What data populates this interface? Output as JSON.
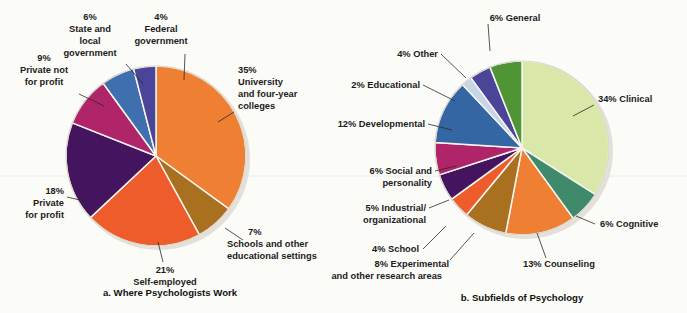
{
  "figure": {
    "background": "#fbfbf8",
    "text_color": "#1b1b1b"
  },
  "chart_data": [
    {
      "type": "pie",
      "id": "where-psychologists-work",
      "title": "a. Where Psychologists Work",
      "caption": "a. Where Psychologists Work",
      "center": [
        156,
        156
      ],
      "radius": 90,
      "start_angle_deg": -90,
      "direction": "clockwise",
      "categories": [
        "University and four-year colleges",
        "Schools and other educational settings",
        "Self-employed",
        "Private for profit",
        "Private not for profit",
        "State and local government",
        "Federal government"
      ],
      "values": [
        35,
        7,
        21,
        18,
        9,
        6,
        4
      ],
      "colors": [
        "#ef8033",
        "#a9711f",
        "#ef5c2b",
        "#44145e",
        "#b0246a",
        "#3f6fae",
        "#4b459a"
      ],
      "labels": [
        {
          "pct": "35%",
          "lines": [
            "35%",
            "University",
            "and four-year",
            "colleges"
          ]
        },
        {
          "pct": "7%",
          "lines": [
            "7%",
            "Schools and other",
            "educational settings"
          ]
        },
        {
          "pct": "21%",
          "lines": [
            "21%",
            "Self-employed"
          ]
        },
        {
          "pct": "18%",
          "lines": [
            "18%",
            "Private",
            "for profit"
          ]
        },
        {
          "pct": "9%",
          "lines": [
            "9%",
            "Private not",
            "for profit"
          ]
        },
        {
          "pct": "6%",
          "lines": [
            "6%",
            "State and",
            "local",
            "government"
          ]
        },
        {
          "pct": "4%",
          "lines": [
            "4%",
            "Federal",
            "government"
          ]
        }
      ],
      "xlabel": "",
      "ylabel": "",
      "legend": "none",
      "grid": false
    },
    {
      "type": "pie",
      "id": "subfields-of-psychology",
      "title": "b. Subfields of Psychology",
      "caption": "b. Subfields of Psychology",
      "center": [
        522,
        148
      ],
      "radius": 87,
      "start_angle_deg": -90,
      "direction": "clockwise",
      "categories": [
        "Clinical",
        "Cognitive",
        "Counseling",
        "Experimental and other research areas",
        "School",
        "Industrial/organizational",
        "Social and personality",
        "Developmental",
        "Educational",
        "Other",
        "General"
      ],
      "values": [
        34,
        6,
        13,
        8,
        4,
        5,
        6,
        12,
        2,
        4,
        6
      ],
      "colors": [
        "#d9e8a8",
        "#3f8a6a",
        "#ef7f33",
        "#a9711f",
        "#ef5c2b",
        "#44145e",
        "#b0246a",
        "#3566a4",
        "#c6d6e8",
        "#4b459a",
        "#4f9435"
      ],
      "labels": [
        {
          "pct": "34%",
          "lines": [
            "34% Clinical"
          ]
        },
        {
          "pct": "6%",
          "lines": [
            "6% Cognitive"
          ]
        },
        {
          "pct": "13%",
          "lines": [
            "13% Counseling"
          ]
        },
        {
          "pct": "8%",
          "lines": [
            "8% Experimental",
            "and other research areas"
          ]
        },
        {
          "pct": "4%",
          "lines": [
            "4% School"
          ]
        },
        {
          "pct": "5%",
          "lines": [
            "5% Industrial/",
            "organizational"
          ]
        },
        {
          "pct": "6%",
          "lines": [
            "6% Social and",
            "personality"
          ]
        },
        {
          "pct": "12%",
          "lines": [
            "12% Developmental"
          ]
        },
        {
          "pct": "2%",
          "lines": [
            "2% Educational"
          ]
        },
        {
          "pct": "4%",
          "lines": [
            "4% Other"
          ]
        },
        {
          "pct": "6%",
          "lines": [
            "6% General"
          ]
        }
      ],
      "xlabel": "",
      "ylabel": "",
      "legend": "none",
      "grid": false
    }
  ],
  "labels_left": {
    "l35": {
      "l0": "35%",
      "l1": "University",
      "l2": "and four-year",
      "l3": "colleges"
    },
    "l7": {
      "l0": "7%",
      "l1": "Schools and other",
      "l2": "educational settings"
    },
    "l21": {
      "l0": "21%",
      "l1": "Self-employed"
    },
    "l18": {
      "l0": "18%",
      "l1": "Private",
      "l2": "for profit"
    },
    "l9": {
      "l0": "9%",
      "l1": "Private not",
      "l2": "for profit"
    },
    "l6": {
      "l0": "6%",
      "l1": "State and",
      "l2": "local",
      "l3": "government"
    },
    "l4": {
      "l0": "4%",
      "l1": "Federal",
      "l2": "government"
    },
    "caption": "a. Where Psychologists Work"
  },
  "labels_right": {
    "r34": {
      "l0": "34% Clinical"
    },
    "r6c": {
      "l0": "6% Cognitive"
    },
    "r13": {
      "l0": "13% Counseling"
    },
    "r8": {
      "l0": "8% Experimental",
      "l1": "and other research areas"
    },
    "r4s": {
      "l0": "4% School"
    },
    "r5": {
      "l0": "5% Industrial/",
      "l1": "organizational"
    },
    "r6s": {
      "l0": "6% Social and",
      "l1": "personality"
    },
    "r12": {
      "l0": "12% Developmental"
    },
    "r2": {
      "l0": "2% Educational"
    },
    "r4o": {
      "l0": "4% Other"
    },
    "r6g": {
      "l0": "6% General"
    },
    "caption": "b. Subfields of Psychology"
  }
}
